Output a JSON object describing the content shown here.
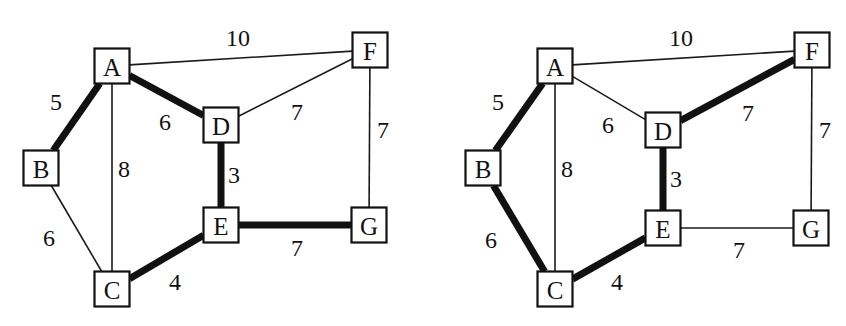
{
  "figure": {
    "background_color": "#ffffff",
    "ink_color": "#111111",
    "width": 846,
    "height": 326
  },
  "style": {
    "thin_stroke_width": 1.6,
    "bold_stroke_width": 7,
    "node_box_size": 35,
    "node_stroke_width": 2.2,
    "node_font_size": 25,
    "weight_font_size": 24
  },
  "chart_data": {
    "type": "diagram",
    "subtype": "weighted-undirected-graph",
    "panels": [
      {
        "id": "left",
        "name": "left-graph",
        "nodes": [
          {
            "id": "A",
            "label": "A",
            "x": 112,
            "y": 66
          },
          {
            "id": "B",
            "label": "B",
            "x": 41,
            "y": 168
          },
          {
            "id": "C",
            "label": "C",
            "x": 112,
            "y": 289
          },
          {
            "id": "D",
            "label": "D",
            "x": 221,
            "y": 125
          },
          {
            "id": "E",
            "label": "E",
            "x": 221,
            "y": 225
          },
          {
            "id": "F",
            "label": "F",
            "x": 370,
            "y": 50
          },
          {
            "id": "G",
            "label": "G",
            "x": 369,
            "y": 225
          }
        ],
        "edges": [
          {
            "from": "A",
            "to": "F",
            "weight": "10",
            "highlighted": false,
            "label_x": 238,
            "label_y": 38
          },
          {
            "from": "A",
            "to": "B",
            "weight": "5",
            "highlighted": true,
            "label_x": 56,
            "label_y": 102
          },
          {
            "from": "A",
            "to": "C",
            "weight": "8",
            "highlighted": false,
            "label_x": 124,
            "label_y": 169
          },
          {
            "from": "A",
            "to": "D",
            "weight": "6",
            "highlighted": true,
            "label_x": 165,
            "label_y": 122
          },
          {
            "from": "B",
            "to": "C",
            "weight": "6",
            "highlighted": false,
            "label_x": 49,
            "label_y": 238
          },
          {
            "from": "C",
            "to": "E",
            "weight": "4",
            "highlighted": true,
            "label_x": 175,
            "label_y": 282
          },
          {
            "from": "D",
            "to": "E",
            "weight": "3",
            "highlighted": true,
            "label_x": 234,
            "label_y": 175
          },
          {
            "from": "D",
            "to": "F",
            "weight": "7",
            "highlighted": false,
            "label_x": 297,
            "label_y": 112
          },
          {
            "from": "E",
            "to": "G",
            "weight": "7",
            "highlighted": true,
            "label_x": 297,
            "label_y": 248
          },
          {
            "from": "F",
            "to": "G",
            "weight": "7",
            "highlighted": false,
            "label_x": 383,
            "label_y": 130
          }
        ]
      },
      {
        "id": "right",
        "name": "right-graph",
        "nodes": [
          {
            "id": "A",
            "label": "A",
            "x": 132,
            "y": 66
          },
          {
            "id": "B",
            "label": "B",
            "x": 60,
            "y": 168
          },
          {
            "id": "C",
            "label": "C",
            "x": 132,
            "y": 289
          },
          {
            "id": "D",
            "label": "D",
            "x": 240,
            "y": 130
          },
          {
            "id": "E",
            "label": "E",
            "x": 240,
            "y": 228
          },
          {
            "id": "F",
            "label": "F",
            "x": 389,
            "y": 50
          },
          {
            "id": "G",
            "label": "G",
            "x": 388,
            "y": 228
          }
        ],
        "edges": [
          {
            "from": "A",
            "to": "F",
            "weight": "10",
            "highlighted": false,
            "label_x": 258,
            "label_y": 38
          },
          {
            "from": "A",
            "to": "B",
            "weight": "5",
            "highlighted": true,
            "label_x": 75,
            "label_y": 102
          },
          {
            "from": "A",
            "to": "C",
            "weight": "8",
            "highlighted": false,
            "label_x": 144,
            "label_y": 169
          },
          {
            "from": "A",
            "to": "D",
            "weight": "6",
            "highlighted": false,
            "label_x": 185,
            "label_y": 125
          },
          {
            "from": "B",
            "to": "C",
            "weight": "6",
            "highlighted": true,
            "label_x": 68,
            "label_y": 240
          },
          {
            "from": "C",
            "to": "E",
            "weight": "4",
            "highlighted": true,
            "label_x": 194,
            "label_y": 282
          },
          {
            "from": "D",
            "to": "E",
            "weight": "3",
            "highlighted": true,
            "label_x": 253,
            "label_y": 179
          },
          {
            "from": "D",
            "to": "F",
            "weight": "7",
            "highlighted": true,
            "label_x": 325,
            "label_y": 113
          },
          {
            "from": "E",
            "to": "G",
            "weight": "7",
            "highlighted": false,
            "label_x": 316,
            "label_y": 250
          },
          {
            "from": "F",
            "to": "G",
            "weight": "7",
            "highlighted": false,
            "label_x": 402,
            "label_y": 130
          }
        ]
      }
    ]
  }
}
